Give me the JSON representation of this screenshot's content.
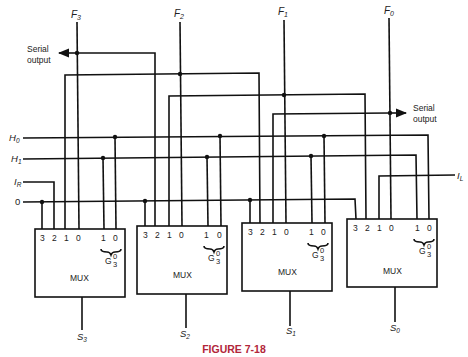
{
  "figure": {
    "caption": "FIGURE 7-18",
    "caption_color": "#b2263a"
  },
  "outputs": {
    "f3": "F",
    "f3_sub": "3",
    "f2": "F",
    "f2_sub": "2",
    "f1": "F",
    "f1_sub": "1",
    "f0": "F",
    "f0_sub": "0"
  },
  "serial_left": {
    "line1": "Serial",
    "line2": "output"
  },
  "serial_right": {
    "line1": "Serial",
    "line2": "output"
  },
  "inputs": {
    "h0": "H",
    "h0_sub": "0",
    "h1": "H",
    "h1_sub": "1",
    "ir": "I",
    "ir_sub": "R",
    "il": "I",
    "il_sub": "L",
    "zero": "0"
  },
  "muxes": [
    {
      "id": "mux3",
      "label": "MUX",
      "inputs": [
        "3",
        "2",
        "1",
        "0"
      ],
      "sel": [
        "1",
        "0"
      ],
      "g": "G",
      "g_top": "0",
      "g_bot": "3",
      "select": "S",
      "select_sub": "3"
    },
    {
      "id": "mux2",
      "label": "MUX",
      "inputs": [
        "3",
        "2",
        "1",
        "0"
      ],
      "sel": [
        "1",
        "0"
      ],
      "g": "G",
      "g_top": "0",
      "g_bot": "3",
      "select": "S",
      "select_sub": "2"
    },
    {
      "id": "mux1",
      "label": "MUX",
      "inputs": [
        "3",
        "2",
        "1",
        "0"
      ],
      "sel": [
        "1",
        "0"
      ],
      "g": "G",
      "g_top": "0",
      "g_bot": "3",
      "select": "S",
      "select_sub": "1"
    },
    {
      "id": "mux0",
      "label": "MUX",
      "inputs": [
        "3",
        "2",
        "1",
        "0"
      ],
      "sel": [
        "1",
        "0"
      ],
      "g": "G",
      "g_top": "0",
      "g_bot": "3",
      "select": "S",
      "select_sub": "0"
    }
  ]
}
